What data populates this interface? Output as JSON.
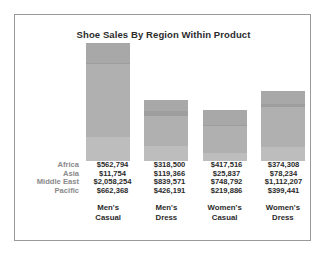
{
  "chart": {
    "title": "Shoe Sales By Region Within Product",
    "frame_color": "#9a9a9a",
    "background": "#ffffff"
  },
  "chart_data": {
    "type": "bar",
    "subtype": "stacked",
    "title": "Shoe Sales By Region Within Product",
    "xlabel": "",
    "ylabel": "",
    "grid": false,
    "legend": "none",
    "value_table_shown": true,
    "categories": [
      "Men's Casual",
      "Men's Dress",
      "Women's Casual",
      "Women's Dress"
    ],
    "category_lines": [
      [
        "Men's",
        "Casual"
      ],
      [
        "Men's",
        "Dress"
      ],
      [
        "Women's",
        "Casual"
      ],
      [
        "Women's",
        "Dress"
      ]
    ],
    "series": [
      {
        "name": "Africa",
        "color": "#a8a8a8",
        "values": [
          562794,
          318500,
          417516,
          374308
        ],
        "labels": [
          "$562,794",
          "$318,500",
          "$417,516",
          "$374,308"
        ]
      },
      {
        "name": "Asia",
        "color": "#9e9e9e",
        "values": [
          11754,
          119366,
          25837,
          78234
        ],
        "labels": [
          "$11,754",
          "$119,366",
          "$25,837",
          "$78,234"
        ]
      },
      {
        "name": "Middle East",
        "color": "#b0b0b0",
        "values": [
          2058254,
          839571,
          748792,
          1112207
        ],
        "labels": [
          "$2,058,254",
          "$839,571",
          "$748,792",
          "$1,112,207"
        ]
      },
      {
        "name": "Pacific",
        "color": "#bdbdbd",
        "values": [
          662368,
          426191,
          219886,
          399441
        ],
        "labels": [
          "$662,368",
          "$426,191",
          "$219,886",
          "$399,441"
        ]
      }
    ],
    "totals": [
      3295170,
      1703628,
      1412031,
      1964190
    ]
  },
  "table": {
    "rows": [
      {
        "label": "Africa",
        "values": [
          "$562,794",
          "$318,500",
          "$417,516",
          "$374,308"
        ]
      },
      {
        "label": "Asia",
        "values": [
          "$11,754",
          "$119,366",
          "$25,837",
          "$78,234"
        ]
      },
      {
        "label": "Middle East",
        "values": [
          "$2,058,254",
          "$839,571",
          "$748,792",
          "$1,112,207"
        ]
      },
      {
        "label": "Pacific",
        "values": [
          "$662,368",
          "$426,191",
          "$219,886",
          "$399,441"
        ]
      }
    ]
  }
}
